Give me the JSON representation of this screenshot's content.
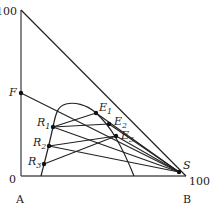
{
  "diagram": {
    "type": "ternary-extraction-diagram",
    "axis_labels": {
      "top_value": "100",
      "origin_value": "0",
      "right_value": "100",
      "corner_a": "A",
      "corner_b": "B"
    },
    "points": {
      "F": {
        "label": "F",
        "x": 21,
        "y": 93
      },
      "S": {
        "label": "S",
        "x": 179,
        "y": 172
      },
      "E1": {
        "label": "E",
        "sub": "1",
        "x": 96,
        "y": 113
      },
      "E2": {
        "label": "E",
        "sub": "2",
        "x": 109,
        "y": 124
      },
      "E3": {
        "label": "E",
        "sub": "3",
        "x": 116,
        "y": 136
      },
      "R1": {
        "label": "R",
        "sub": "1",
        "x": 53,
        "y": 127
      },
      "R2": {
        "label": "R",
        "sub": "2",
        "x": 49,
        "y": 146
      },
      "R3": {
        "label": "R",
        "sub": "3",
        "x": 44,
        "y": 164
      }
    },
    "colors": {
      "line": "#222222",
      "axis": "#555555"
    }
  }
}
